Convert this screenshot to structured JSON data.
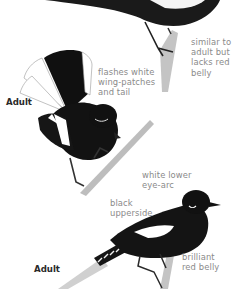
{
  "page": {
    "colors": {
      "background": "#ffffff",
      "plumage": "#141414",
      "annotation_text": "#8a8a8a",
      "heading_text": "#2a2a2a",
      "branch": "#b9b9b9"
    }
  },
  "figures": [
    {
      "id": "top-bird",
      "annotation": "similar to\nadult but\nlacks red\nbelly"
    },
    {
      "id": "middle-bird",
      "heading": "Adult",
      "annotation": "flashes white\nwing-patches\nand tail"
    },
    {
      "id": "bottom-bird",
      "heading": "Adult",
      "annotations": [
        "white lower\neye-arc",
        "black\nupperside",
        "brilliant\nred belly"
      ]
    }
  ]
}
